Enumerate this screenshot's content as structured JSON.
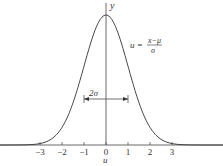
{
  "chart_data": {
    "type": "line",
    "title": "",
    "xlabel": "u",
    "ylabel": "y",
    "x_ticks": [
      "-3",
      "-2",
      "-1",
      "0",
      "1",
      "2",
      "3"
    ],
    "xlim": [
      -4.8,
      5.2
    ],
    "curve": "standard normal density y = exp(-u^2/2)/sqrt(2*pi)",
    "annotations": {
      "formula_lhs": "u =",
      "formula_num": "x−μ",
      "formula_den": "σ",
      "width_label": "2σ",
      "width_span": [
        -1,
        1
      ]
    },
    "grid": false,
    "legend": "none"
  }
}
